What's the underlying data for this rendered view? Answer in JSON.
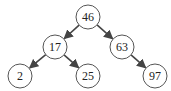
{
  "tree": {
    "nodes": [
      {
        "id": "n46",
        "label": "46",
        "x": 88,
        "y": 17
      },
      {
        "id": "n17",
        "label": "17",
        "x": 55,
        "y": 47
      },
      {
        "id": "n63",
        "label": "63",
        "x": 122,
        "y": 47
      },
      {
        "id": "n2",
        "label": "2",
        "x": 20,
        "y": 76
      },
      {
        "id": "n25",
        "label": "25",
        "x": 88,
        "y": 76
      },
      {
        "id": "n97",
        "label": "97",
        "x": 155,
        "y": 76
      }
    ],
    "edges": [
      {
        "from": "n46",
        "to": "n17"
      },
      {
        "from": "n46",
        "to": "n63"
      },
      {
        "from": "n17",
        "to": "n2"
      },
      {
        "from": "n17",
        "to": "n25"
      },
      {
        "from": "n63",
        "to": "n97"
      }
    ],
    "colors": {
      "node_stroke": "#555555",
      "edge": "#444444",
      "text": "#222222"
    }
  }
}
